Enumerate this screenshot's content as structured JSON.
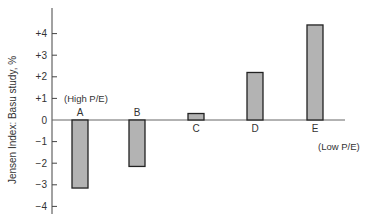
{
  "chart_data": {
    "type": "bar",
    "title": "",
    "xlabel": "",
    "ylabel": "Jensen Index: Basu study, %",
    "categories": [
      "A",
      "B",
      "C",
      "D",
      "E"
    ],
    "values": [
      -3.15,
      -2.15,
      0.3,
      2.2,
      4.4
    ],
    "ylim": [
      -4,
      4.5
    ],
    "yticks": [
      "+4",
      "+3",
      "+2",
      "+1",
      "0",
      "−1",
      "−2",
      "−3",
      "−4"
    ],
    "ytick_values": [
      4,
      3,
      2,
      1,
      0,
      -1,
      -2,
      -3,
      -4
    ],
    "annotations": [
      {
        "text": "(High P/E)",
        "near": "A"
      },
      {
        "text": "(Low P/E)",
        "near": "E"
      }
    ],
    "grid": false,
    "bar_color": "#b3b3b3",
    "bar_edge_color": "#222222"
  }
}
